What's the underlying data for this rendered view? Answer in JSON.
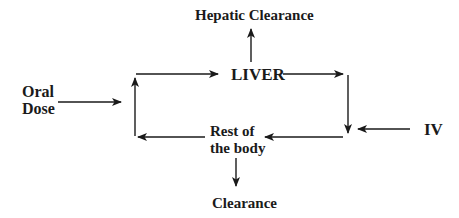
{
  "diagram": {
    "nodes": {
      "hepatic_clearance": "Hepatic Clearance",
      "liver": "LIVER",
      "oral_dose_line1": "Oral",
      "oral_dose_line2": "Dose",
      "iv": "IV",
      "rest_line1": "Rest of",
      "rest_line2": "the body",
      "clearance": "Clearance"
    },
    "edges": [
      {
        "from": "Oral Dose",
        "to": "left loop"
      },
      {
        "from": "left loop",
        "to": "LIVER"
      },
      {
        "from": "LIVER",
        "to": "Hepatic Clearance"
      },
      {
        "from": "LIVER",
        "to": "right loop"
      },
      {
        "from": "IV",
        "to": "right loop"
      },
      {
        "from": "right loop",
        "to": "Rest of the body"
      },
      {
        "from": "Rest of the body",
        "to": "left loop"
      },
      {
        "from": "Rest of the body",
        "to": "Clearance"
      }
    ],
    "colors": {
      "stroke": "#1a1a1a",
      "background": "#ffffff"
    }
  }
}
